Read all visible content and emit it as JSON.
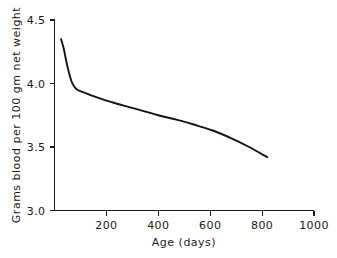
{
  "chart_data": {
    "type": "line",
    "title": "",
    "xlabel": "Age  (days)",
    "ylabel": "Grams blood per 100 gm net weight",
    "xlim": [
      0,
      1000
    ],
    "ylim": [
      3.0,
      4.5
    ],
    "xticks": [
      200,
      400,
      600,
      800,
      1000
    ],
    "xtick_labels": [
      "200",
      "400",
      "600",
      "800",
      "1000"
    ],
    "yticks": [
      3.0,
      3.5,
      4.0,
      4.5
    ],
    "ytick_labels": [
      "3.0",
      "3.5",
      "4.0",
      "4.5"
    ],
    "grid": false,
    "legend": false,
    "series": [
      {
        "name": "Blood volume",
        "x": [
          25,
          35,
          45,
          55,
          65,
          75,
          85,
          100,
          120,
          150,
          200,
          260,
          330,
          400,
          470,
          540,
          610,
          680,
          750,
          820
        ],
        "y": [
          4.35,
          4.28,
          4.18,
          4.09,
          4.02,
          3.98,
          3.955,
          3.94,
          3.925,
          3.9,
          3.865,
          3.83,
          3.79,
          3.75,
          3.715,
          3.675,
          3.63,
          3.57,
          3.5,
          3.42
        ]
      }
    ],
    "colors": {
      "curve": "#141414",
      "axis": "#1a1a1a",
      "background": "#ffffff",
      "text": "#1a1a1a"
    }
  }
}
